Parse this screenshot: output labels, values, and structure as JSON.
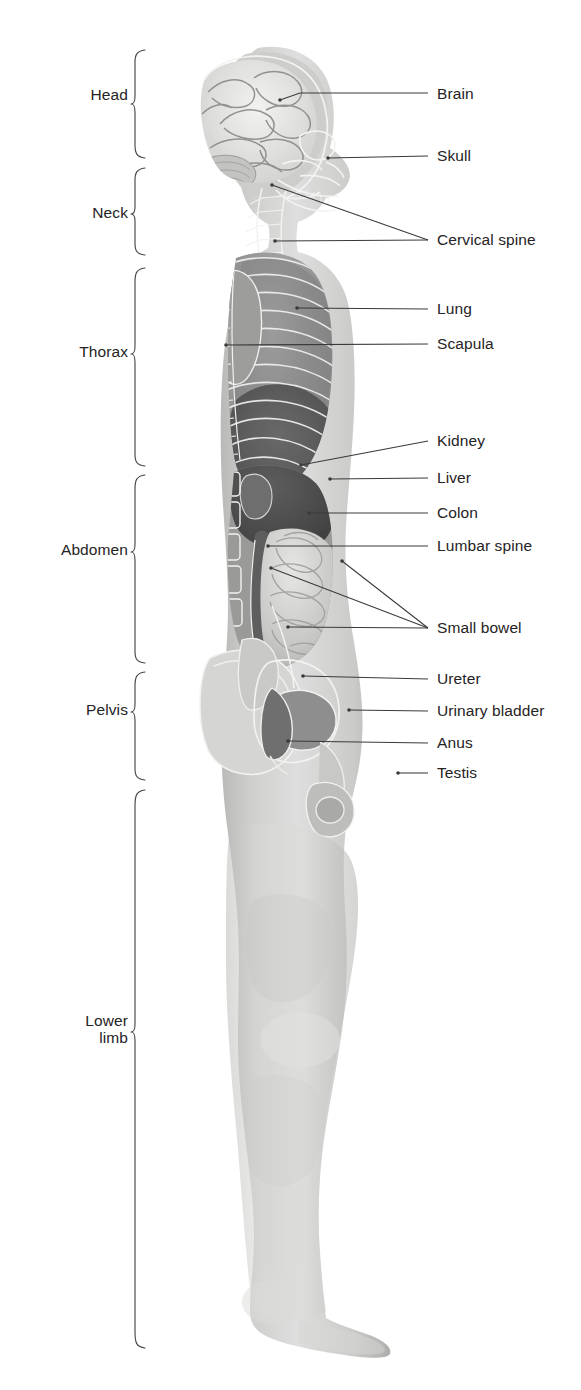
{
  "figure": {
    "view": "lateral (sagittal) silhouette of an adult male",
    "background_color": "#ffffff",
    "text_color": "#262324",
    "leader_line_color": "#3a3a3c",
    "brace_color": "#4a4749"
  },
  "regions": [
    {
      "id": "head",
      "label": "Head",
      "y_top": 50,
      "y_bottom": 158,
      "label_x_right": 128,
      "label_y": 95
    },
    {
      "id": "neck",
      "label": "Neck",
      "y_top": 168,
      "y_bottom": 255,
      "label_x_right": 128,
      "label_y": 213
    },
    {
      "id": "thorax",
      "label": "Thorax",
      "y_top": 268,
      "y_bottom": 466,
      "label_x_right": 128,
      "label_y": 352
    },
    {
      "id": "abdomen",
      "label": "Abdomen",
      "y_top": 475,
      "y_bottom": 663,
      "label_x_right": 128,
      "label_y": 550
    },
    {
      "id": "pelvis",
      "label": "Pelvis",
      "y_top": 672,
      "y_bottom": 780,
      "label_x_right": 128,
      "label_y": 710
    },
    {
      "id": "lower-limb",
      "label": "Lower\nlimb",
      "y_top": 790,
      "y_bottom": 1348,
      "label_x_right": 128,
      "label_y": 1030
    }
  ],
  "organs": [
    {
      "id": "brain",
      "label": "Brain",
      "label_x": 437,
      "label_y": 94,
      "line": [
        [
          280,
          100
        ],
        [
          300,
          93
        ],
        [
          428,
          93
        ]
      ]
    },
    {
      "id": "skull",
      "label": "Skull",
      "label_x": 437,
      "label_y": 156,
      "line": [
        [
          328,
          158
        ],
        [
          428,
          156
        ]
      ]
    },
    {
      "id": "cervical-spine",
      "label": "Cervical spine",
      "label_x": 437,
      "label_y": 240,
      "line": [
        [
          272,
          185
        ],
        [
          428,
          240
        ]
      ]
    },
    {
      "id": "lung",
      "label": "Lung",
      "label_x": 437,
      "label_y": 309,
      "line": [
        [
          297,
          308
        ],
        [
          428,
          309
        ]
      ]
    },
    {
      "id": "scapula",
      "label": "Scapula",
      "label_x": 437,
      "label_y": 344,
      "line": [
        [
          226,
          345
        ],
        [
          428,
          344
        ]
      ]
    },
    {
      "id": "kidney",
      "label": "Kidney",
      "label_x": 437,
      "label_y": 441,
      "line": [
        [
          301,
          465
        ],
        [
          428,
          441
        ]
      ]
    },
    {
      "id": "liver",
      "label": "Liver",
      "label_x": 437,
      "label_y": 478,
      "line": [
        [
          330,
          479
        ],
        [
          428,
          478
        ]
      ]
    },
    {
      "id": "colon",
      "label": "Colon",
      "label_x": 437,
      "label_y": 513,
      "line": [
        [
          309,
          513
        ],
        [
          428,
          513
        ]
      ]
    },
    {
      "id": "lumbar-spine",
      "label": "Lumbar spine",
      "label_x": 437,
      "label_y": 546,
      "line": [
        [
          268,
          546
        ],
        [
          428,
          546
        ]
      ]
    },
    {
      "id": "small-bowel-1",
      "label": "",
      "label_x": 0,
      "label_y": 0,
      "line": [
        [
          271,
          568
        ],
        [
          428,
          628
        ]
      ]
    },
    {
      "id": "small-bowel",
      "label": "Small bowel",
      "label_x": 437,
      "label_y": 628,
      "line": [
        [
          342,
          561
        ],
        [
          428,
          628
        ]
      ]
    },
    {
      "id": "small-bowel-2",
      "label": "",
      "label_x": 0,
      "label_y": 0,
      "line": [
        [
          288,
          627
        ],
        [
          428,
          628
        ]
      ]
    },
    {
      "id": "ureter",
      "label": "Ureter",
      "label_x": 437,
      "label_y": 679,
      "line": [
        [
          303,
          676
        ],
        [
          428,
          679
        ]
      ]
    },
    {
      "id": "urinary-bladder",
      "label": "Urinary bladder",
      "label_x": 437,
      "label_y": 711,
      "line": [
        [
          349,
          710
        ],
        [
          428,
          711
        ]
      ]
    },
    {
      "id": "anus",
      "label": "Anus",
      "label_x": 437,
      "label_y": 743,
      "line": [
        [
          288,
          741
        ],
        [
          428,
          743
        ]
      ]
    },
    {
      "id": "testis",
      "label": "Testis",
      "label_x": 437,
      "label_y": 773,
      "line": [
        [
          400,
          773
        ],
        [
          428,
          773
        ]
      ]
    }
  ],
  "anatomy_notes": {
    "head": [
      "cerebrum with gyri and sulci",
      "cerebellum",
      "facial skeleton",
      "mandible and teeth"
    ],
    "thorax": [
      "rib cage",
      "lung field",
      "scapula",
      "diaphragm dome"
    ],
    "abdomen": [
      "liver",
      "kidney",
      "colon",
      "small bowel loops",
      "lumbar vertebrae"
    ],
    "pelvis": [
      "hip bone / ilium",
      "urinary bladder",
      "ureter",
      "rectum and anus",
      "testis and scrotum"
    ],
    "lower_limb": [
      "thigh",
      "knee",
      "calf",
      "ankle",
      "foot with toes"
    ]
  }
}
